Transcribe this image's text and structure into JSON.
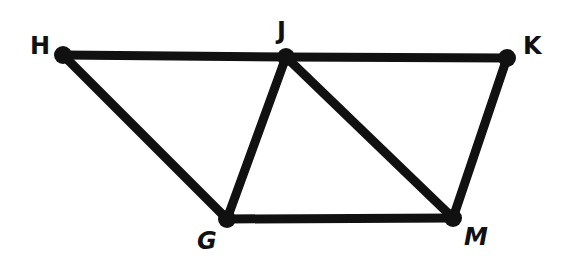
{
  "diagram": {
    "type": "geometry-figure",
    "stroke_color": "#111111",
    "background": "#ffffff",
    "points": [
      {
        "name": "H",
        "x": 63,
        "y": 55,
        "label_x": 30,
        "label_y": 34
      },
      {
        "name": "J",
        "x": 286,
        "y": 57,
        "label_x": 276,
        "label_y": 19
      },
      {
        "name": "K",
        "x": 507,
        "y": 58,
        "label_x": 523,
        "label_y": 33
      },
      {
        "name": "G",
        "x": 227,
        "y": 219,
        "label_x": 197,
        "label_y": 228
      },
      {
        "name": "M",
        "x": 453,
        "y": 218,
        "label_x": 465,
        "label_y": 225
      }
    ],
    "segments": [
      [
        "H",
        "J"
      ],
      [
        "J",
        "K"
      ],
      [
        "H",
        "G"
      ],
      [
        "G",
        "J"
      ],
      [
        "J",
        "M"
      ],
      [
        "G",
        "M"
      ],
      [
        "K",
        "M"
      ]
    ],
    "labels": {
      "H": "H",
      "J": "J",
      "K": "K",
      "G": "G",
      "M": "M"
    }
  }
}
